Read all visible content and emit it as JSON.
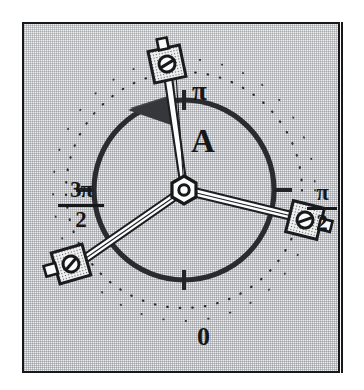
{
  "figure": {
    "kind": "rotary-dial-diagram",
    "caption_letter": "A",
    "labels": {
      "top": "π",
      "bottom": "0",
      "left_numerator": "3π",
      "left_denominator": "2",
      "right_numerator": "π",
      "right_denominator": "2",
      "inner": "A"
    },
    "colors": {
      "ink": "#161719",
      "panel_border": "#17181a",
      "panel_fill": "#eeeeee",
      "rim": "#2a2b2e"
    },
    "geometry": {
      "center_x": 160,
      "center_y": 166,
      "rim_radius": 90,
      "outer_dotted_radius": 118,
      "rim_stroke": 5,
      "arm_angles_deg": [
        100,
        -15,
        215
      ],
      "tick_angles_deg": [
        90,
        0,
        180,
        270
      ]
    },
    "elements": {
      "hub": "hex-nut-hub",
      "arms": 3,
      "arm_end": "square-screw-pad",
      "rotation_arrow": "counter-clockwise-arrowhead",
      "outer_guide": "dotted-arc"
    }
  }
}
